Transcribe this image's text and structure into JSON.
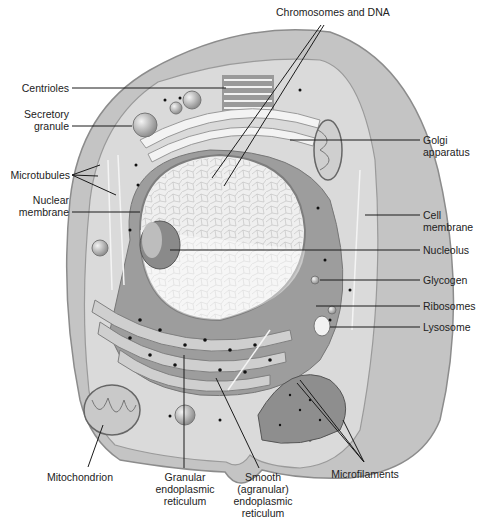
{
  "diagram": {
    "type": "labeled-illustration",
    "colors": {
      "cell_outer": "#b9b9b9",
      "cytoplasm": "#d9d9d9",
      "nucleus": "#ededed",
      "organelle_dark": "#8a8a8a",
      "leader_line": "#1a1a1a",
      "label_text": "#222222"
    },
    "labels": {
      "chromosomes": "Chromosomes and DNA",
      "centrioles": "Centrioles",
      "secretory_1": "Secretory",
      "secretory_2": "granule",
      "microtubules": "Microtubules",
      "nuclear_1": "Nuclear",
      "nuclear_2": "membrane",
      "golgi_1": "Golgi",
      "golgi_2": "apparatus",
      "cell_1": "Cell",
      "cell_2": "membrane",
      "nucleolus": "Nucleolus",
      "glycogen": "Glycogen",
      "ribosomes": "Ribosomes",
      "lysosome": "Lysosome",
      "mitochondrion": "Mitochondrion",
      "granular_1": "Granular",
      "granular_2": "endoplasmic",
      "granular_3": "reticulum",
      "smooth_1": "Smooth",
      "smooth_2": "(agranular)",
      "smooth_3": "endoplasmic",
      "smooth_4": "reticulum",
      "microfilaments": "Microfilaments"
    }
  }
}
